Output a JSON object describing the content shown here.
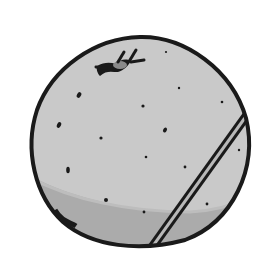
{
  "image": {
    "subject": "orange fruit illustration",
    "style": "grayscale line drawing",
    "colors": {
      "background": "#ffffff",
      "fruit_fill": "#c8c8c8",
      "fruit_shadow": "#a9a9a9",
      "outline": "#1a1a1a",
      "stem_fill": "#8a8a8a"
    }
  }
}
